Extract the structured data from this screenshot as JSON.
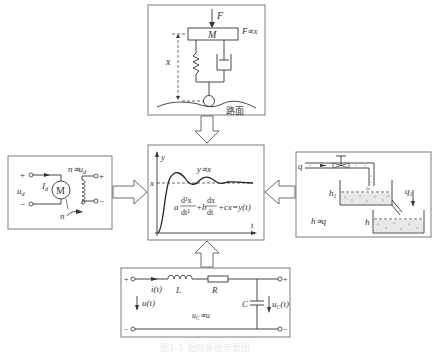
{
  "diagram": {
    "type": "analogy-of-systems",
    "center": {
      "axis_y": "y",
      "axis_t": "t",
      "level_label": "x",
      "relation": "y∝x",
      "equation": {
        "a": "a",
        "d2x": "d²x",
        "dt2": "dt²",
        "plus_b": "+b",
        "dx": "dx",
        "dt": "dt",
        "tail": "+cx=y(t)"
      }
    },
    "top": {
      "force": "F",
      "mass": "M",
      "displacement": "x",
      "relation": "F∝x",
      "road": "路面"
    },
    "left": {
      "plus": "+",
      "minus": "−",
      "input_voltage": "u",
      "input_sub": "d",
      "current": "I",
      "current_sub": "d",
      "motor": "M",
      "relation": "n∝u",
      "relation_sub": "d",
      "speed": "n",
      "out_plus": "+",
      "out_minus": "−"
    },
    "right": {
      "inflow": "q",
      "level1": "h",
      "level1_sub": "1",
      "outflow": "q",
      "outflow_sub": "1",
      "level2": "h",
      "relation": "h∝q"
    },
    "bottom": {
      "in_plus": "+",
      "in_minus": "−",
      "current": "i(t)",
      "inductor": "L",
      "resistor": "R",
      "capacitor": "C",
      "input_voltage": "u(t)",
      "cap_voltage": "u",
      "cap_voltage_sub": "C",
      "cap_voltage_tail": "(t)",
      "relation": "u",
      "relation_sub": "C",
      "relation_tail": "∝u",
      "out_plus": "+",
      "out_minus": "−"
    },
    "caption": "图1-1 相似系统示意图"
  },
  "colors": {
    "border": "#7a7a7a",
    "ink": "#333333",
    "background": "#ffffff"
  }
}
